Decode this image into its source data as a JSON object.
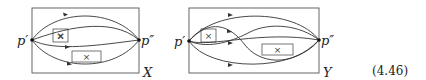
{
  "figure": {
    "equation_number": "(4.46)",
    "left_diagram": {
      "frame_label": "X",
      "start_point_label": "p′",
      "end_point_label": "p″",
      "obstacles": [
        {
          "symbol": "×"
        },
        {
          "symbol": "×"
        }
      ],
      "path_count": 4
    },
    "right_diagram": {
      "frame_label": "Y",
      "start_point_label": "p′",
      "end_point_label": "p″",
      "obstacles": [
        {
          "symbol": "×"
        },
        {
          "symbol": "×"
        }
      ],
      "path_count": 5
    }
  }
}
